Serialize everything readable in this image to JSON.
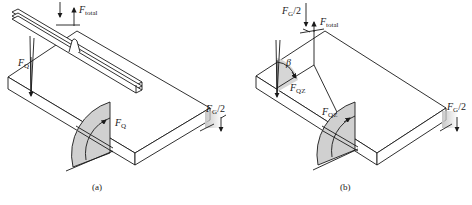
{
  "figure_a": {
    "caption": "(a)",
    "labels": {
      "f_total": {
        "sym": "F",
        "sub": "total"
      },
      "f_q_left": {
        "sym": "F",
        "sub": "Q"
      },
      "f_q_arc": {
        "sym": "F",
        "sub": "Q"
      },
      "f_g_half": {
        "sym": "F",
        "sub": "G",
        "suffix": "/2"
      }
    }
  },
  "figure_b": {
    "caption": "(b)",
    "labels": {
      "f_g_half_top": {
        "sym": "F",
        "sub": "G",
        "suffix": "/2"
      },
      "f_total": {
        "sym": "F",
        "sub": "total"
      },
      "beta": {
        "sym": "β"
      },
      "f_qz_left": {
        "sym": "F",
        "sub": "QZ"
      },
      "f_qz_arc": {
        "sym": "F",
        "sub": "QZ"
      },
      "f_g_half_right": {
        "sym": "F",
        "sub": "G",
        "suffix": "/2"
      }
    }
  },
  "colors": {
    "line": "#1a1a1a",
    "shade": "#c8c8c8"
  }
}
